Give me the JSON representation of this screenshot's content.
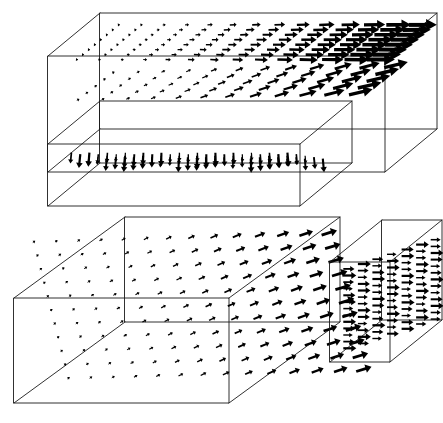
{
  "figure": {
    "background_color": "#ffffff",
    "line_color": "#1a1a1a",
    "arrow_color": "#000000",
    "width": 443,
    "height": 423
  },
  "chart_data": {
    "type": "scatter",
    "subtitle": "Arrow-glyph velocity field on two orthogonal cut-plane sets",
    "xlabel": "",
    "ylabel": "",
    "grid": false,
    "legend": null,
    "panels": [
      {
        "name": "upper-panel",
        "label": "Upper panel",
        "boxes": [
          {
            "name": "upper-main-box",
            "label": "Main domain box",
            "origin": [
              48,
              56
            ],
            "dx": [
              337,
              0
            ],
            "dy": [
              0,
              116
            ],
            "dz": [
              52,
              -43
            ]
          },
          {
            "name": "upper-front-box",
            "label": "Front slab box",
            "origin": [
              48,
              144
            ],
            "dx": [
              252,
              0
            ],
            "dy": [
              0,
              62
            ],
            "dz": [
              52,
              -43
            ]
          }
        ],
        "fields": [
          {
            "name": "upper-back-plane",
            "label": "Horizontal back plane (streamwise jet)",
            "orientation": "horizontal",
            "cols": 14,
            "rows": 8,
            "growth": "left-to-right",
            "min_length": 2,
            "max_length": 30,
            "min_width": 0.9,
            "max_width": 4.2,
            "angle_deg": 0
          },
          {
            "name": "upper-mid-plane",
            "label": "Inclined mid plane",
            "orientation": "diagonal",
            "cols": 12,
            "rows": 5,
            "growth": "left-to-right",
            "min_length": 3,
            "max_length": 26,
            "min_width": 0.9,
            "max_width": 3.6,
            "angle_deg": -28
          },
          {
            "name": "upper-front-plane",
            "label": "Front slab downwash plane",
            "orientation": "vertical",
            "cols": 13,
            "rows": 5,
            "growth": "uniform",
            "min_length": 7,
            "max_length": 14,
            "min_width": 1.1,
            "max_width": 2.2,
            "angle_deg": 90
          }
        ]
      },
      {
        "name": "lower-panel",
        "label": "Lower panel",
        "boxes": [
          {
            "name": "lower-main-box",
            "label": "Main domain box",
            "origin": [
              14,
              298
            ],
            "dx": [
              215,
              0
            ],
            "dy": [
              0,
              105
            ],
            "dz": [
              111,
              -81
            ]
          },
          {
            "name": "lower-side-box",
            "label": "Detached side box",
            "origin": [
              330,
              262
            ],
            "dx": [
              60,
              0
            ],
            "dy": [
              0,
              100
            ],
            "dz": [
              52,
              -42
            ]
          }
        ],
        "fields": [
          {
            "name": "lower-oblique-plane",
            "label": "Oblique cut plane with rising arrows",
            "orientation": "diagonal",
            "cols": 14,
            "rows": 11,
            "growth": "left-to-right",
            "min_length": 3,
            "max_length": 17,
            "min_width": 0.9,
            "max_width": 3.0,
            "angle_deg": -36
          },
          {
            "name": "lower-side-plane",
            "label": "Side box horizontal outflow plane",
            "orientation": "horizontal",
            "cols": 7,
            "rows": 13,
            "growth": "uniform",
            "min_length": 9,
            "max_length": 13,
            "min_width": 1.3,
            "max_width": 2.3,
            "angle_deg": 0
          }
        ]
      }
    ]
  }
}
